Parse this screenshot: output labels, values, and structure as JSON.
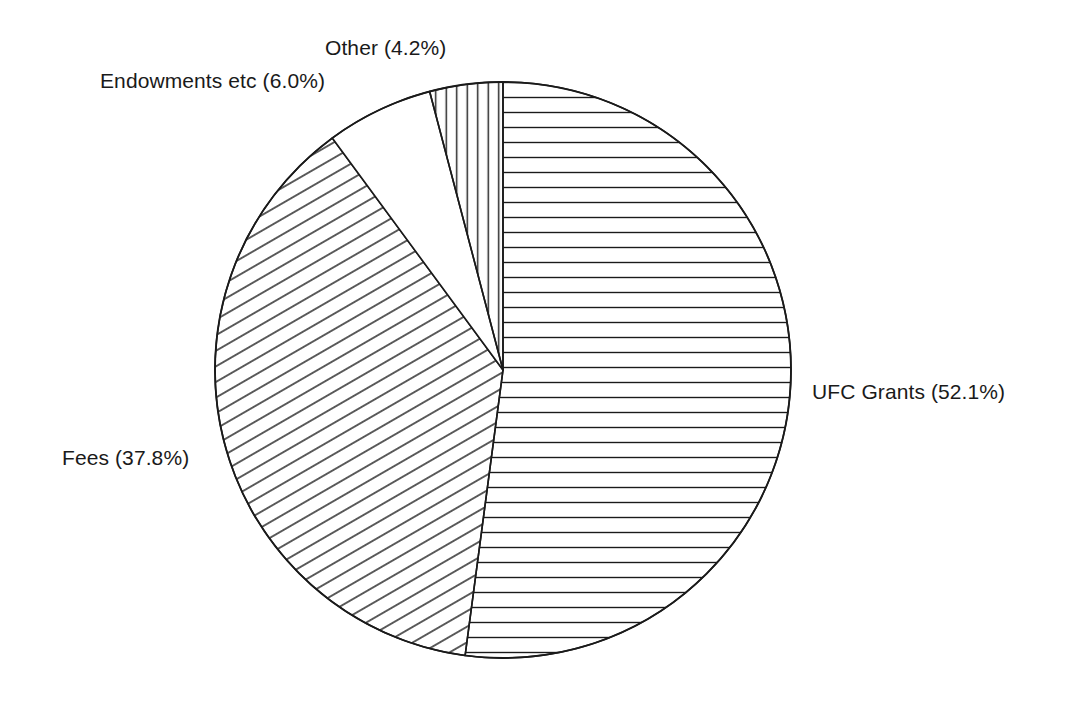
{
  "chart_data": {
    "type": "pie",
    "title": "",
    "subtitle": "",
    "xlabel": "",
    "ylabel": "",
    "grid": false,
    "legend_position": "none",
    "label_format": "{name} ({value}%)",
    "start_angle_deg": 0,
    "direction": "clockwise",
    "center": {
      "x": 503,
      "y": 370
    },
    "radius": 288,
    "categories": [
      "UFC Grants",
      "Fees",
      "Endowments etc",
      "Other"
    ],
    "values": [
      52.1,
      37.8,
      6.0,
      4.2
    ],
    "slices": [
      {
        "name": "UFC Grants",
        "value": 52.1,
        "value_text": "52.1",
        "label": "UFC Grants (52.1%)",
        "hatch": "horizontal",
        "fill": "#ffffff",
        "stroke": "#1a1a1a",
        "start_deg": 0,
        "end_deg": 187.56
      },
      {
        "name": "Fees",
        "value": 37.8,
        "value_text": "37.8",
        "label": "Fees (37.8%)",
        "hatch": "diagonal",
        "fill": "#ffffff",
        "stroke": "#1a1a1a",
        "start_deg": 187.56,
        "end_deg": 323.64
      },
      {
        "name": "Endowments etc",
        "value": 6.0,
        "value_text": "6.0",
        "label": "Endowments etc (6.0%)",
        "hatch": "none",
        "fill": "#ffffff",
        "stroke": "#1a1a1a",
        "start_deg": 323.64,
        "end_deg": 345.24
      },
      {
        "name": "Other",
        "value": 4.2,
        "value_text": "4.2",
        "label": "Other (4.2%)",
        "hatch": "vertical",
        "fill": "#ffffff",
        "stroke": "#1a1a1a",
        "start_deg": 345.24,
        "end_deg": 360
      }
    ],
    "colors": {
      "background": "#ffffff",
      "outline": "#1a1a1a",
      "text": "#1a1a1a"
    }
  }
}
